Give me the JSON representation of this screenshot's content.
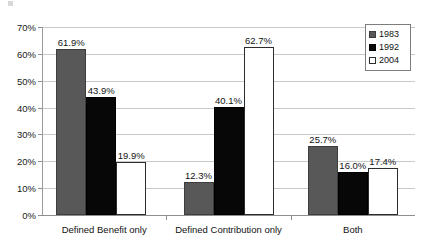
{
  "chart_data": {
    "type": "bar",
    "title": "",
    "subtitle": "",
    "xlabel": "",
    "ylabel": "",
    "categories": [
      "Defined Benefit only",
      "Defined Contribution only",
      "Both"
    ],
    "series": [
      {
        "name": "1983",
        "color": "#585858",
        "values": [
          61.9,
          12.3,
          25.7
        ],
        "labels": [
          "61.9%",
          "12.3%",
          "25.7%"
        ]
      },
      {
        "name": "1992",
        "color": "#070707",
        "values": [
          43.9,
          40.1,
          16.0
        ],
        "labels": [
          "43.9%",
          "40.1%",
          "16.0%"
        ]
      },
      {
        "name": "2004",
        "color": "#ffffff",
        "values": [
          19.9,
          62.7,
          17.4
        ],
        "labels": [
          "19.9%",
          "62.7%",
          "17.4%"
        ]
      }
    ],
    "ylim": [
      0,
      70
    ],
    "yticks": [
      0,
      10,
      20,
      30,
      40,
      50,
      60,
      70
    ],
    "ytick_labels": [
      "0%",
      "10%",
      "20%",
      "30%",
      "40%",
      "50%",
      "60%",
      "70%"
    ],
    "grid": true,
    "legend_position": "top-right",
    "value_suffix": "%"
  },
  "legend": {
    "entries": [
      {
        "label": "1983",
        "swatch": "gray-swatch"
      },
      {
        "label": "1992",
        "swatch": "black-swatch"
      },
      {
        "label": "2004",
        "swatch": "white-swatch"
      }
    ]
  },
  "colors": {
    "series_1983": "#585858",
    "series_1992": "#070707",
    "series_2004": "#ffffff",
    "gridline": "#c9c9c9",
    "axis": "#8e8e8e",
    "background": "#ffffff",
    "text": "#111111"
  }
}
